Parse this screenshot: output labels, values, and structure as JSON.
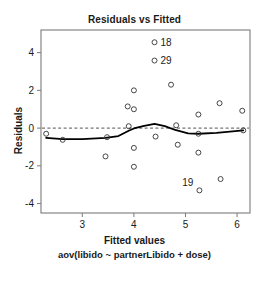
{
  "chart_data": {
    "type": "scatter",
    "title": "Residuals vs Fitted",
    "xlabel": "Fitted values",
    "ylabel": "Residuals",
    "sub_caption": "aov(libido ~ partnerLibido + dose)",
    "xlim": [
      2.2,
      6.25
    ],
    "ylim": [
      -4.5,
      5.2
    ],
    "xticks": [
      "3",
      "4",
      "5",
      "6"
    ],
    "xtick_values": [
      3,
      4,
      5,
      6
    ],
    "yticks": [
      "4",
      "2",
      "0",
      "-2",
      "-4"
    ],
    "ytick_values": [
      4,
      2,
      0,
      -2,
      -4
    ],
    "grid": false,
    "legend": "none",
    "reference_line": {
      "y": 0,
      "style": "dashed",
      "color": "#555555"
    },
    "points": [
      {
        "x": 2.3,
        "y": -0.3
      },
      {
        "x": 2.62,
        "y": -0.62
      },
      {
        "x": 3.45,
        "y": -1.5
      },
      {
        "x": 3.48,
        "y": -0.48
      },
      {
        "x": 3.88,
        "y": 1.15
      },
      {
        "x": 3.9,
        "y": 0.1
      },
      {
        "x": 4.0,
        "y": 2.0
      },
      {
        "x": 4.0,
        "y": 1.0
      },
      {
        "x": 4.0,
        "y": -1.05
      },
      {
        "x": 4.0,
        "y": -2.05
      },
      {
        "x": 4.4,
        "y": 4.55,
        "label": "18"
      },
      {
        "x": 4.4,
        "y": 3.58,
        "label": "29"
      },
      {
        "x": 4.42,
        "y": -0.45
      },
      {
        "x": 4.72,
        "y": 2.3
      },
      {
        "x": 4.82,
        "y": 0.15
      },
      {
        "x": 4.85,
        "y": -0.88
      },
      {
        "x": 5.25,
        "y": 0.72
      },
      {
        "x": 5.25,
        "y": -0.3
      },
      {
        "x": 5.25,
        "y": -1.3
      },
      {
        "x": 5.27,
        "y": -3.3,
        "label": "19"
      },
      {
        "x": 5.66,
        "y": 1.32
      },
      {
        "x": 5.68,
        "y": -2.7
      },
      {
        "x": 6.1,
        "y": 0.92
      },
      {
        "x": 6.12,
        "y": -0.12
      }
    ],
    "smooth_line": {
      "name": "loess",
      "color": "#000000",
      "points": [
        {
          "x": 2.3,
          "y": -0.52
        },
        {
          "x": 2.62,
          "y": -0.58
        },
        {
          "x": 3.0,
          "y": -0.58
        },
        {
          "x": 3.45,
          "y": -0.52
        },
        {
          "x": 3.7,
          "y": -0.42
        },
        {
          "x": 3.9,
          "y": -0.14
        },
        {
          "x": 4.0,
          "y": -0.02
        },
        {
          "x": 4.2,
          "y": 0.12
        },
        {
          "x": 4.4,
          "y": 0.22
        },
        {
          "x": 4.6,
          "y": 0.1
        },
        {
          "x": 4.8,
          "y": -0.1
        },
        {
          "x": 5.05,
          "y": -0.28
        },
        {
          "x": 5.25,
          "y": -0.3
        },
        {
          "x": 5.6,
          "y": -0.25
        },
        {
          "x": 6.12,
          "y": -0.12
        }
      ]
    }
  }
}
